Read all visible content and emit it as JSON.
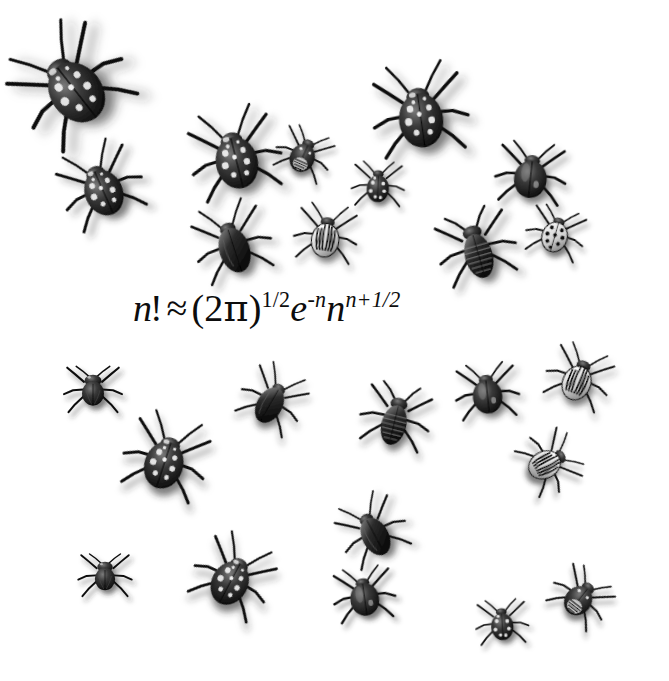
{
  "page": {
    "background_color": "#ffffff",
    "ink_color": "#0d0d0d",
    "width": 669,
    "height": 681
  },
  "formula": {
    "name": "stirling-approximation",
    "plain_text": "n! ≈ (2π)^(1/2) e^(-n) n^(n+1/2)",
    "parts": {
      "n": "n",
      "factorial": "!",
      "approx": "≈",
      "paren_open": "(",
      "two": "2",
      "pi": "π",
      "paren_close": ")",
      "exp_half": "1/2",
      "e": "e",
      "exp_minus_n": "-n",
      "n2": "n",
      "exp_n_plus_half": "n+1/2"
    },
    "x": 133,
    "y": 286,
    "font_size": 38
  },
  "beetles": [
    {
      "id": "beetle-01",
      "species": "spotted-weevil",
      "x": 18,
      "y": 32,
      "w": 105,
      "h": 105,
      "rot": -38,
      "scale": 1.18
    },
    {
      "id": "beetle-02",
      "species": "spotted-weevil",
      "x": 55,
      "y": 140,
      "w": 92,
      "h": 92,
      "rot": -24,
      "scale": 0.98
    },
    {
      "id": "beetle-03",
      "species": "spotted-weevil",
      "x": 185,
      "y": 105,
      "w": 100,
      "h": 100,
      "rot": -14,
      "scale": 1.0
    },
    {
      "id": "beetle-04",
      "species": "striped-shell-bug",
      "x": 268,
      "y": 118,
      "w": 72,
      "h": 72,
      "rot": 24,
      "scale": 0.86
    },
    {
      "id": "beetle-05",
      "species": "spotted-weevil",
      "x": 370,
      "y": 62,
      "w": 100,
      "h": 100,
      "rot": -8,
      "scale": 1.05
    },
    {
      "id": "beetle-06",
      "species": "ladybird-dark",
      "x": 344,
      "y": 150,
      "w": 68,
      "h": 68,
      "rot": 2,
      "scale": 0.86
    },
    {
      "id": "beetle-07",
      "species": "glossy-dome",
      "x": 490,
      "y": 132,
      "w": 82,
      "h": 82,
      "rot": 6,
      "scale": 0.95
    },
    {
      "id": "beetle-08",
      "species": "smooth-ground-beetle",
      "x": 186,
      "y": 196,
      "w": 92,
      "h": 92,
      "rot": -18,
      "scale": 0.92
    },
    {
      "id": "beetle-09",
      "species": "colorado-potato-beetle",
      "x": 288,
      "y": 196,
      "w": 76,
      "h": 76,
      "rot": 8,
      "scale": 0.92
    },
    {
      "id": "beetle-10",
      "species": "ribbed-stag-beetle",
      "x": 430,
      "y": 200,
      "w": 92,
      "h": 92,
      "rot": -16,
      "scale": 0.94
    },
    {
      "id": "beetle-11",
      "species": "ladybird-white",
      "x": 520,
      "y": 196,
      "w": 72,
      "h": 72,
      "rot": 16,
      "scale": 0.9
    },
    {
      "id": "beetle-12",
      "species": "hairy-fly-beetle",
      "x": 58,
      "y": 352,
      "w": 70,
      "h": 70,
      "rot": 0,
      "scale": 0.92
    },
    {
      "id": "beetle-13",
      "species": "spotted-weevil",
      "x": 118,
      "y": 410,
      "w": 96,
      "h": 96,
      "rot": 18,
      "scale": 0.96
    },
    {
      "id": "beetle-14",
      "species": "smooth-ground-beetle",
      "x": 232,
      "y": 358,
      "w": 82,
      "h": 82,
      "rot": 30,
      "scale": 0.86
    },
    {
      "id": "beetle-15",
      "species": "ribbed-stag-beetle",
      "x": 352,
      "y": 372,
      "w": 88,
      "h": 88,
      "rot": 14,
      "scale": 0.88
    },
    {
      "id": "beetle-16",
      "species": "glossy-dome",
      "x": 448,
      "y": 352,
      "w": 78,
      "h": 78,
      "rot": -6,
      "scale": 0.9
    },
    {
      "id": "beetle-17",
      "species": "colorado-potato-beetle",
      "x": 540,
      "y": 338,
      "w": 78,
      "h": 78,
      "rot": 22,
      "scale": 0.92
    },
    {
      "id": "beetle-18",
      "species": "colorado-potato-beetle",
      "x": 512,
      "y": 424,
      "w": 76,
      "h": 76,
      "rot": 62,
      "scale": 0.9
    },
    {
      "id": "beetle-19",
      "species": "smooth-ground-beetle",
      "x": 330,
      "y": 488,
      "w": 84,
      "h": 84,
      "rot": -28,
      "scale": 0.88
    },
    {
      "id": "beetle-20",
      "species": "hairy-fly-beetle",
      "x": 72,
      "y": 540,
      "w": 66,
      "h": 66,
      "rot": 0,
      "scale": 0.9
    },
    {
      "id": "beetle-21",
      "species": "spotted-weevil",
      "x": 186,
      "y": 530,
      "w": 94,
      "h": 94,
      "rot": 28,
      "scale": 0.92
    },
    {
      "id": "beetle-22",
      "species": "glossy-dome",
      "x": 326,
      "y": 556,
      "w": 76,
      "h": 76,
      "rot": -8,
      "scale": 0.9
    },
    {
      "id": "beetle-23",
      "species": "ladybird-dark",
      "x": 468,
      "y": 588,
      "w": 68,
      "h": 68,
      "rot": -4,
      "scale": 0.86
    },
    {
      "id": "beetle-24",
      "species": "striped-shell-bug",
      "x": 544,
      "y": 560,
      "w": 74,
      "h": 74,
      "rot": 38,
      "scale": 0.9
    }
  ],
  "species_legend": [
    {
      "key": "spotted-weevil",
      "label": "Spotted weevil-like beetle"
    },
    {
      "key": "striped-shell-bug",
      "label": "Striped-shell beetle"
    },
    {
      "key": "ladybird-dark",
      "label": "Dark ladybird with pale spots"
    },
    {
      "key": "ladybird-white",
      "label": "Pale ladybird with black spots"
    },
    {
      "key": "glossy-dome",
      "label": "Glossy domed beetle"
    },
    {
      "key": "smooth-ground-beetle",
      "label": "Smooth ground beetle"
    },
    {
      "key": "colorado-potato-beetle",
      "label": "Striped Colorado potato beetle"
    },
    {
      "key": "ribbed-stag-beetle",
      "label": "Ribbed elongated beetle"
    },
    {
      "key": "hairy-fly-beetle",
      "label": "Compact hairy beetle"
    }
  ]
}
